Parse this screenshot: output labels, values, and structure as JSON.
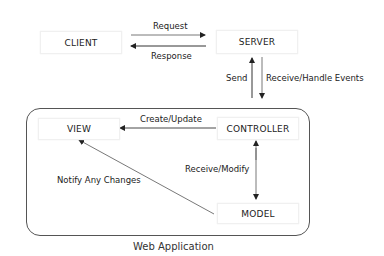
{
  "nodes": {
    "client": "CLIENT",
    "server": "SERVER",
    "view": "VIEW",
    "controller": "CONTROLLER",
    "model": "MODEL"
  },
  "edges": {
    "request": "Request",
    "response": "Response",
    "send": "Send",
    "receive_handle": "Receive/Handle Events",
    "create_update": "Create/Update",
    "receive_modify": "Receive/Modify",
    "notify": "Notify Any Changes"
  },
  "container": {
    "label": "Web Application"
  },
  "colors": {
    "line": "#333333",
    "box_border": "#eeeeee"
  }
}
